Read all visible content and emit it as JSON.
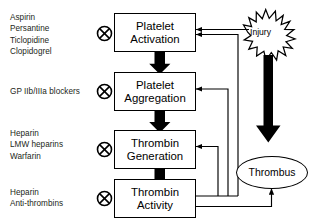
{
  "diagram": {
    "colors": {
      "stroke": "#000000",
      "text": "#231f20",
      "background": "#ffffff",
      "thick_arrow": "#000000"
    },
    "drug_groups": [
      {
        "name": "antiplatelet-agents",
        "lines": [
          "Aspirin",
          "Persantine",
          "Ticlopidine",
          "Clopidogrel"
        ],
        "inhibits": "Platelet Activation",
        "marker": "inhibition-circle-x"
      },
      {
        "name": "gp-iib-iiia-blockers",
        "lines": [
          "GP IIb/IIIa blockers"
        ],
        "inhibits": "Platelet Aggregation",
        "marker": "inhibition-circle-x"
      },
      {
        "name": "anticoagulants",
        "lines": [
          "Heparin",
          "LMW heparins",
          "Warfarin"
        ],
        "inhibits": "Thrombin Generation",
        "marker": "inhibition-circle-x"
      },
      {
        "name": "direct-thrombin-inhibitors",
        "lines": [
          "Heparin",
          "Anti-thrombins"
        ],
        "inhibits": "Thrombin Activity",
        "marker": "inhibition-circle-x"
      }
    ],
    "nodes": [
      {
        "id": "platelet-activation",
        "line1": "Platelet",
        "line2": "Activation"
      },
      {
        "id": "platelet-aggregation",
        "line1": "Platelet",
        "line2": "Aggregation"
      },
      {
        "id": "thrombin-generation",
        "line1": "Thrombin",
        "line2": "Generation"
      },
      {
        "id": "thrombin-activity",
        "line1": "Thrombin",
        "line2": "Activity"
      }
    ],
    "stimulus": {
      "id": "injury",
      "label": "Injury",
      "shape": "starburst"
    },
    "outcome": {
      "id": "thrombus",
      "label": "Thrombus",
      "shape": "ellipse"
    },
    "edges": [
      {
        "from": "injury",
        "to": "platelet-activation",
        "style": "thin-arrow"
      },
      {
        "from": "injury",
        "to": "thrombus",
        "style": "thick-black-arrow"
      },
      {
        "from": "platelet-activation",
        "to": "platelet-aggregation",
        "style": "thick-block-arrow"
      },
      {
        "from": "platelet-aggregation",
        "to": "thrombin-generation",
        "style": "thick-block-arrow"
      },
      {
        "from": "thrombin-generation",
        "to": "thrombin-activity",
        "style": "thick-block-arrow"
      },
      {
        "from": "thrombin-activity",
        "to": "platelet-activation",
        "style": "thin-feedback-arrow"
      },
      {
        "from": "thrombin-activity",
        "to": "platelet-aggregation",
        "style": "thin-feedback-arrow"
      },
      {
        "from": "thrombin-activity",
        "to": "thrombin-generation",
        "style": "thin-feedback-arrow"
      },
      {
        "from": "thrombin-activity",
        "to": "thrombus",
        "style": "thin-arrow"
      }
    ]
  }
}
